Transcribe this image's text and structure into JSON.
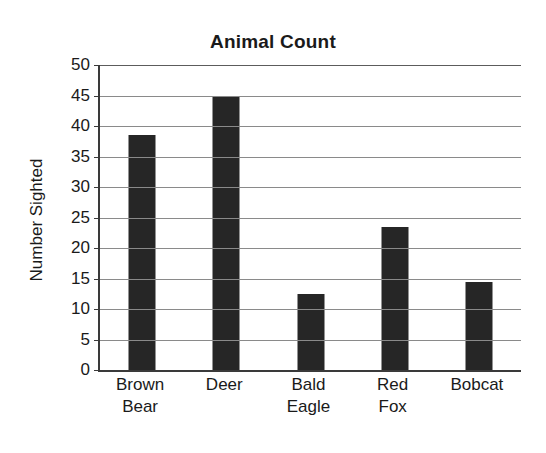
{
  "chart_data": {
    "type": "bar",
    "title": "Animal Count",
    "xlabel": "",
    "ylabel": "Number Sighted",
    "categories": [
      "Brown Bear",
      "Deer",
      "Bald Eagle",
      "Red Fox",
      "Bobcat"
    ],
    "category_lines": [
      [
        "Brown",
        "Bear"
      ],
      [
        "Deer",
        ""
      ],
      [
        "Bald",
        "Eagle"
      ],
      [
        "Red",
        "Fox"
      ],
      [
        "Bobcat",
        ""
      ]
    ],
    "values": [
      38.5,
      45,
      12.5,
      23.5,
      14.5
    ],
    "ylim": [
      0,
      50
    ],
    "ytick_labels": [
      "50",
      "45",
      "40",
      "35",
      "30",
      "25",
      "20",
      "15",
      "10",
      "5",
      "0"
    ],
    "ytick_values": [
      50,
      45,
      40,
      35,
      30,
      25,
      20,
      15,
      10,
      5,
      0
    ],
    "ytick_step": 5,
    "grid": true,
    "legend": "none",
    "bar_color": "#262626",
    "gridline_color": "#8a8a8a",
    "axis_color": "#3a3a3a",
    "background_color": "#ffffff"
  }
}
